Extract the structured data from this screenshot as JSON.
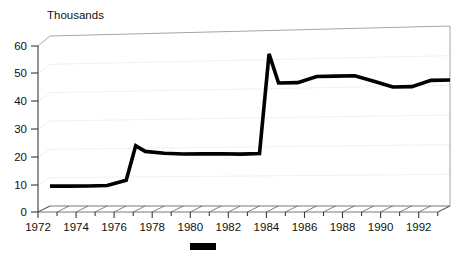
{
  "chart_data": {
    "type": "line",
    "title": "",
    "unit_label": "Thousands",
    "xlabel": "",
    "ylabel": "",
    "xlim": [
      1972,
      1993
    ],
    "ylim": [
      0,
      60
    ],
    "yticks": [
      0,
      10,
      20,
      30,
      40,
      50,
      60
    ],
    "ytick_labels": [
      "0",
      "10",
      "20",
      "30",
      "40",
      "50",
      "60"
    ],
    "xticks": [
      1972,
      1974,
      1976,
      1978,
      1980,
      1982,
      1984,
      1986,
      1988,
      1990,
      1992
    ],
    "xtick_labels": [
      "1972",
      "1974",
      "1976",
      "1978",
      "1980",
      "1982",
      "1984",
      "1986",
      "1988",
      "1990",
      "1992"
    ],
    "x_minor_tick_step": 1,
    "grid": true,
    "grid_axis": "y",
    "legend_position": "bottom-center",
    "legend_entries": [
      {
        "label": "",
        "color": "#000000",
        "marker": "solid-rect"
      }
    ],
    "style": {
      "three_d": true,
      "line_color": "#000000",
      "line_width_px": 3.6,
      "grid_color": "#c9c9c9",
      "wall_color": "#9a9a9a",
      "axis_color": "#3a3a3a",
      "background": "#ffffff"
    },
    "x": [
      1972,
      1973,
      1974,
      1975,
      1976,
      1976.5,
      1977,
      1978,
      1979,
      1980,
      1981,
      1982,
      1983,
      1983.5,
      1984,
      1985,
      1986,
      1987,
      1988,
      1989,
      1990,
      1991,
      1992,
      1993
    ],
    "values": [
      7,
      7,
      7,
      7.2,
      9,
      21,
      19,
      18.3,
      18,
      18,
      18,
      17.8,
      18,
      52,
      42,
      42,
      44,
      44,
      44,
      42,
      40,
      40,
      42,
      42
    ],
    "series": [
      {
        "name": "",
        "color": "#000000",
        "x": [
          1972,
          1973,
          1974,
          1975,
          1976,
          1976.5,
          1977,
          1978,
          1979,
          1980,
          1981,
          1982,
          1983,
          1983.5,
          1984,
          1985,
          1986,
          1987,
          1988,
          1989,
          1990,
          1991,
          1992,
          1993
        ],
        "values": [
          7,
          7,
          7,
          7.2,
          9,
          21,
          19,
          18.3,
          18,
          18,
          18,
          17.8,
          18,
          52,
          42,
          42,
          44,
          44,
          44,
          42,
          40,
          40,
          42,
          42
        ]
      }
    ],
    "annotations": []
  }
}
